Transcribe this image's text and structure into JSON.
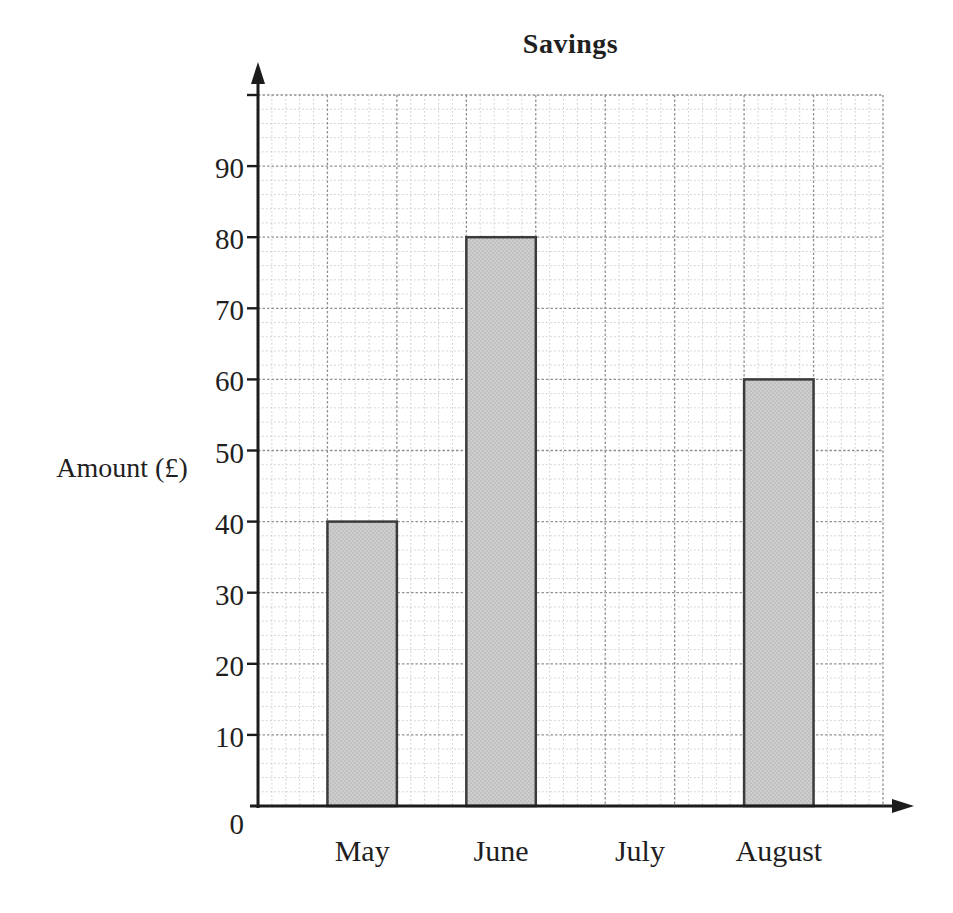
{
  "page": {
    "background": "#ffffff"
  },
  "chart_data": {
    "type": "bar",
    "title": "Savings",
    "xlabel": "",
    "ylabel": "Amount (£)",
    "categories": [
      "May",
      "June",
      "July",
      "August"
    ],
    "values": [
      40,
      80,
      0,
      60
    ],
    "y_ticks": [
      0,
      10,
      20,
      30,
      40,
      50,
      60,
      70,
      80,
      90
    ],
    "ylim": [
      0,
      100
    ],
    "legend": "none",
    "grid": "graph-paper: minor line every 2 units, major line every 10 units, dotted",
    "layout": {
      "bar_columns": [
        1,
        3,
        5,
        7
      ],
      "major_columns": 9,
      "bar_width_columns": 1,
      "axis_arrows": true
    },
    "colors": {
      "background": "#ffffff",
      "bar_fill": "#cecece",
      "bar_stipple": "#a9a9a9",
      "bar_border": "#3b3b3b",
      "grid_minor": "#c9cccf",
      "grid_major": "#8e9194",
      "axis": "#1c1c1c",
      "text": "#1f1f1f"
    }
  }
}
